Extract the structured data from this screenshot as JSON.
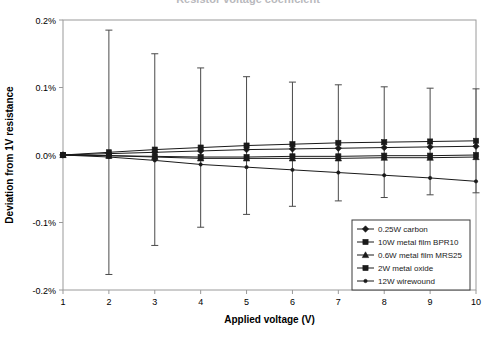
{
  "chart_data": {
    "type": "line",
    "title": "Resistor voltage coefficient",
    "title_visible": false,
    "xlabel": "Applied voltage (V)",
    "ylabel": "Deviation from 1V resistance",
    "x": [
      1,
      2,
      3,
      4,
      5,
      6,
      7,
      8,
      9,
      10
    ],
    "xlim": [
      1,
      10
    ],
    "ylim": [
      -0.2,
      0.2
    ],
    "xticks": [
      "1",
      "2",
      "3",
      "4",
      "5",
      "6",
      "7",
      "8",
      "9",
      "10"
    ],
    "yticks": [
      "0.2%",
      "0.1%",
      "0.0%",
      "-0.1%",
      "-0.2%"
    ],
    "ytick_values": [
      0.2,
      0.1,
      0.0,
      -0.1,
      -0.2
    ],
    "grid": false,
    "legend_position": "bottom-right",
    "units": "%",
    "series": [
      {
        "name": "0.25W carbon",
        "marker": "diamond",
        "values": [
          0.0,
          0.002,
          0.004,
          0.006,
          0.008,
          0.009,
          0.01,
          0.011,
          0.012,
          0.013
        ]
      },
      {
        "name": "10W metal film BPR10",
        "marker": "square",
        "values": [
          0.0,
          0.004,
          0.008,
          0.011,
          0.014,
          0.016,
          0.018,
          0.019,
          0.02,
          0.021
        ],
        "error": [
          0.0,
          0.181,
          0.142,
          0.118,
          0.102,
          0.092,
          0.086,
          0.082,
          0.079,
          0.077
        ]
      },
      {
        "name": "0.6W metal film MRS25",
        "marker": "triangle",
        "values": [
          0.0,
          -0.001,
          -0.003,
          -0.005,
          -0.005,
          -0.005,
          -0.005,
          -0.004,
          -0.004,
          -0.003
        ]
      },
      {
        "name": "2W metal oxide",
        "marker": "square",
        "values": [
          0.0,
          -0.001,
          -0.002,
          -0.003,
          -0.003,
          -0.002,
          -0.002,
          -0.001,
          -0.001,
          0.0
        ]
      },
      {
        "name": "12W wirewound",
        "marker": "dot",
        "values": [
          0.0,
          -0.003,
          -0.008,
          -0.014,
          -0.018,
          -0.022,
          -0.026,
          -0.03,
          -0.034,
          -0.039
        ]
      }
    ]
  }
}
